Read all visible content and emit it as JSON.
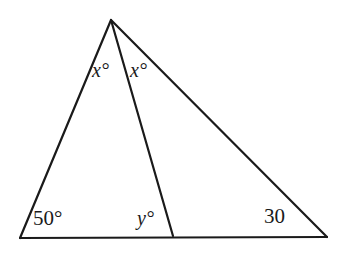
{
  "figure": {
    "kind": "geometry-diagram",
    "background_color": "#ffffff",
    "stroke_color": "#1a1a1a",
    "stroke_width": 2.2,
    "text_color": "#1a1a1a"
  },
  "points": {
    "apex": {
      "name": "apex",
      "x": 111,
      "y": 20
    },
    "bottom_left": {
      "name": "bottom-left",
      "x": 20,
      "y": 238
    },
    "cevian_foot": {
      "name": "cevian-foot",
      "x": 173,
      "y": 236
    },
    "bottom_right": {
      "name": "bottom-right",
      "x": 327,
      "y": 237
    }
  },
  "segments": [
    {
      "name": "left-side",
      "from": "apex",
      "to": "bottom_left"
    },
    {
      "name": "right-side",
      "from": "apex",
      "to": "bottom_right"
    },
    {
      "name": "base",
      "from": "bottom_left",
      "to": "bottom_right"
    },
    {
      "name": "cevian",
      "from": "apex",
      "to": "cevian_foot"
    }
  ],
  "labels": {
    "x_left": {
      "text": "x°",
      "style": "italic"
    },
    "x_right": {
      "text": "x°",
      "style": "italic"
    },
    "angle_50": {
      "text": "50°",
      "style": "upright"
    },
    "y": {
      "text": "y°",
      "style": "italic"
    },
    "angle_30": {
      "text": "30",
      "style": "upright"
    }
  }
}
